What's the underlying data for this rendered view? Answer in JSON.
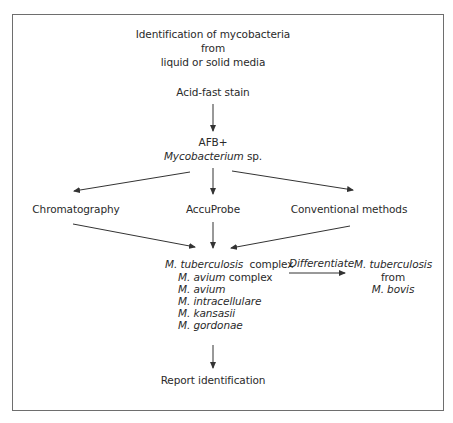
{
  "diagram": {
    "title_lines": [
      "Identification of mycobacteria",
      "from",
      "liquid or solid media"
    ],
    "step_stain": "Acid-fast stain",
    "step_afb": {
      "line1": "AFB+",
      "genus": "Mycobacterium",
      "suffix": " sp."
    },
    "methods": [
      "Chromatography",
      "AccuProbe",
      "Conventional methods"
    ],
    "species_list": [
      {
        "genus": "M. tuberculosis",
        "rest": "  complex",
        "italic_rest": false
      },
      {
        "genus": "M. avium",
        "rest": " complex",
        "italic_rest": false
      },
      {
        "genus": "M. avium",
        "rest": "",
        "italic_rest": false
      },
      {
        "genus": "M. intracellulare",
        "rest": "",
        "italic_rest": false
      },
      {
        "genus": "M. kansasii",
        "rest": "",
        "italic_rest": false
      },
      {
        "genus": "M. gordonae",
        "rest": "",
        "italic_rest": false
      }
    ],
    "differentiate_label": "Differentiate",
    "differentiate_result": [
      "M. tuberculosis",
      "from",
      "M. bovis"
    ],
    "final_step": "Report identification"
  },
  "colors": {
    "frame": "#6e6e6e",
    "text": "#2a2a2a",
    "arrow": "#333333"
  }
}
